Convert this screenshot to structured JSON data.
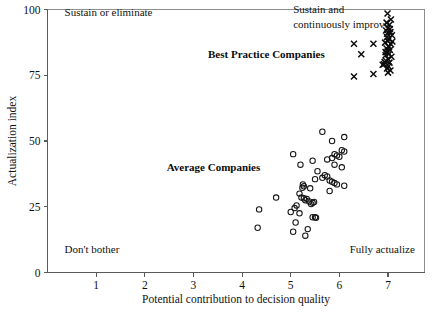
{
  "chart_data": {
    "type": "scatter",
    "title": "",
    "xlabel": "Potential contribution to decision quality",
    "ylabel": "Actualization index",
    "xlim": [
      0.0,
      7.75
    ],
    "ylim": [
      0,
      100
    ],
    "xticks": [
      1,
      2,
      3,
      4,
      5,
      6,
      7
    ],
    "yticks": [
      0,
      25,
      50,
      75,
      100
    ],
    "grid": false,
    "legend": "none",
    "annotations": [
      {
        "text": "Sustain or eliminate",
        "x": 0.35,
        "y": 97.5,
        "align": "left",
        "style": "plain"
      },
      {
        "text": "Sustain and",
        "x": 5.05,
        "y": 98.5,
        "align": "left",
        "style": "plain"
      },
      {
        "text": "continuously improve",
        "x": 5.05,
        "y": 93.0,
        "align": "left",
        "style": "plain"
      },
      {
        "text": "Best Practice Companies",
        "x": 3.3,
        "y": 81.5,
        "align": "left",
        "style": "bold"
      },
      {
        "text": "Average Companies",
        "x": 2.45,
        "y": 38.5,
        "align": "left",
        "style": "bold"
      },
      {
        "text": "Don't bother",
        "x": 0.35,
        "y": 7.5,
        "align": "left",
        "style": "plain"
      },
      {
        "text": "Fully actualize",
        "x": 7.55,
        "y": 7.5,
        "align": "right",
        "style": "plain"
      }
    ],
    "series": [
      {
        "name": "Best Practice Companies",
        "marker": "x",
        "color": "#0d0d0d",
        "points": [
          [
            6.99,
            98.5
          ],
          [
            7.06,
            96.2
          ],
          [
            6.97,
            95.0
          ],
          [
            7.03,
            94.2
          ],
          [
            7.0,
            93.0
          ],
          [
            6.96,
            92.0
          ],
          [
            7.05,
            91.4
          ],
          [
            7.08,
            90.2
          ],
          [
            6.98,
            89.5
          ],
          [
            7.02,
            88.8
          ],
          [
            7.0,
            88.0
          ],
          [
            6.94,
            87.4
          ],
          [
            7.06,
            86.8
          ],
          [
            7.01,
            86.0
          ],
          [
            6.97,
            85.2
          ],
          [
            7.04,
            84.6
          ],
          [
            6.99,
            84.0
          ],
          [
            7.02,
            83.2
          ],
          [
            6.95,
            82.6
          ],
          [
            7.07,
            82.0
          ],
          [
            7.0,
            81.2
          ],
          [
            6.96,
            80.4
          ],
          [
            7.03,
            79.8
          ],
          [
            6.92,
            79.2
          ],
          [
            7.01,
            78.4
          ],
          [
            6.98,
            77.6
          ],
          [
            7.05,
            76.8
          ],
          [
            7.0,
            76.0
          ],
          [
            6.93,
            80.0
          ],
          [
            6.89,
            79.0
          ],
          [
            7.04,
            92.6
          ],
          [
            6.98,
            90.8
          ],
          [
            7.09,
            87.8
          ],
          [
            7.02,
            85.8
          ],
          [
            6.95,
            83.8
          ],
          [
            6.3,
            87.0
          ],
          [
            6.7,
            87.0
          ],
          [
            6.45,
            83.0
          ],
          [
            6.3,
            74.5
          ],
          [
            6.7,
            75.5
          ]
        ]
      },
      {
        "name": "Average Companies",
        "marker": "o",
        "color": "#161616",
        "points": [
          [
            5.65,
            53.5
          ],
          [
            6.1,
            51.5
          ],
          [
            5.85,
            50.0
          ],
          [
            6.05,
            46.5
          ],
          [
            6.1,
            46.0
          ],
          [
            5.9,
            45.0
          ],
          [
            5.95,
            44.5
          ],
          [
            6.0,
            44.0
          ],
          [
            5.85,
            43.5
          ],
          [
            5.75,
            43.0
          ],
          [
            5.05,
            45.0
          ],
          [
            5.45,
            42.5
          ],
          [
            5.2,
            41.0
          ],
          [
            5.9,
            41.0
          ],
          [
            6.05,
            40.0
          ],
          [
            5.55,
            38.5
          ],
          [
            5.7,
            37.0
          ],
          [
            5.75,
            36.5
          ],
          [
            5.65,
            36.0
          ],
          [
            5.5,
            35.5
          ],
          [
            5.8,
            35.0
          ],
          [
            5.85,
            34.5
          ],
          [
            5.9,
            34.0
          ],
          [
            5.95,
            33.5
          ],
          [
            5.25,
            33.5
          ],
          [
            5.27,
            32.8
          ],
          [
            5.24,
            32.2
          ],
          [
            5.4,
            32.0
          ],
          [
            6.1,
            33.0
          ],
          [
            5.8,
            31.0
          ],
          [
            5.18,
            30.0
          ],
          [
            5.22,
            28.5
          ],
          [
            5.27,
            28.2
          ],
          [
            5.33,
            28.0
          ],
          [
            5.3,
            27.5
          ],
          [
            5.38,
            27.0
          ],
          [
            5.45,
            26.5
          ],
          [
            5.42,
            26.0
          ],
          [
            5.48,
            26.8
          ],
          [
            4.7,
            28.5
          ],
          [
            5.12,
            25.5
          ],
          [
            5.08,
            24.5
          ],
          [
            5.0,
            23.0
          ],
          [
            4.35,
            24.0
          ],
          [
            5.18,
            22.5
          ],
          [
            5.45,
            21.0
          ],
          [
            5.5,
            21.0
          ],
          [
            5.52,
            20.8
          ],
          [
            5.1,
            19.0
          ],
          [
            4.32,
            17.0
          ],
          [
            5.05,
            15.5
          ],
          [
            5.3,
            14.0
          ],
          [
            5.35,
            16.5
          ]
        ]
      }
    ]
  }
}
